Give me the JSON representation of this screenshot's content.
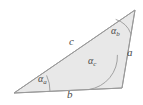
{
  "figure": {
    "type": "triangle-diagram",
    "background_color": "#ffffff",
    "fill_color": "#e8e8e8",
    "stroke_color": "#9a9a9a",
    "label_color": "#4a4a4a",
    "width": 143,
    "height": 105
  },
  "geometry": {
    "vertices": {
      "left": {
        "x": 14,
        "y": 93
      },
      "top_right": {
        "x": 135,
        "y": 10
      },
      "bottom_right": {
        "x": 122,
        "y": 88
      }
    }
  },
  "sides": [
    {
      "id": "a",
      "label": "a",
      "position": "right",
      "from": "top_right",
      "to": "bottom_right"
    },
    {
      "id": "b",
      "label": "b",
      "position": "bottom",
      "from": "left",
      "to": "bottom_right"
    },
    {
      "id": "c",
      "label": "c",
      "position": "upper-left",
      "from": "left",
      "to": "top_right"
    }
  ],
  "angles": [
    {
      "id": "alpha_a",
      "symbol": "α",
      "subscript": "a",
      "vertex": "left"
    },
    {
      "id": "alpha_b",
      "symbol": "α",
      "subscript": "b",
      "vertex": "top_right"
    },
    {
      "id": "alpha_c",
      "symbol": "α",
      "subscript": "c",
      "vertex": "bottom_right"
    }
  ]
}
